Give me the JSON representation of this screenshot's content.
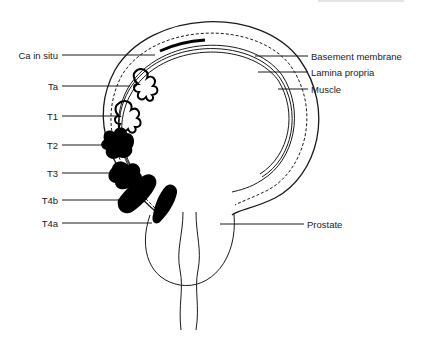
{
  "figure": {
    "left_labels": [
      {
        "id": "ca-in-situ",
        "text": "Ca in situ"
      },
      {
        "id": "ta",
        "text": "Ta"
      },
      {
        "id": "t1",
        "text": "T1"
      },
      {
        "id": "t2",
        "text": "T2"
      },
      {
        "id": "t3",
        "text": "T3"
      },
      {
        "id": "t4b",
        "text": "T4b"
      },
      {
        "id": "t4a",
        "text": "T4a"
      }
    ],
    "right_labels": [
      {
        "id": "basement-membrane",
        "text": "Basement membrane"
      },
      {
        "id": "lamina-propria",
        "text": "Lamina propria"
      },
      {
        "id": "muscle",
        "text": "Muscle"
      },
      {
        "id": "prostate",
        "text": "Prostate"
      }
    ],
    "colors": {
      "line": "#1a1a1a",
      "tumor": "#000000",
      "background": "#ffffff"
    }
  }
}
